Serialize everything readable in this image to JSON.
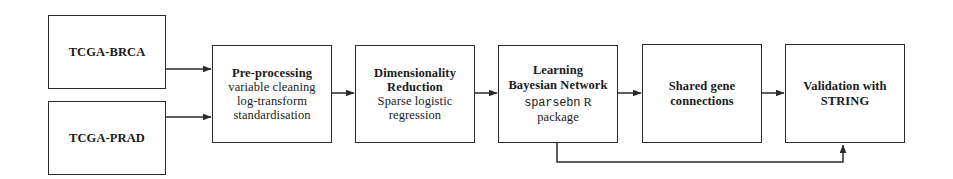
{
  "diagram": {
    "background_color": "#ffffff",
    "stroke_color": "#2a2a2a",
    "nodes": [
      {
        "id": "brca",
        "lines": [
          {
            "text": "TCGA-BRCA",
            "style": "bold"
          }
        ]
      },
      {
        "id": "prad",
        "lines": [
          {
            "text": "TCGA-PRAD",
            "style": "bold"
          }
        ]
      },
      {
        "id": "preproc",
        "lines": [
          {
            "text": "Pre-processing",
            "style": "bold"
          },
          {
            "text": "variable cleaning",
            "style": "regular"
          },
          {
            "text": "log-transform",
            "style": "regular"
          },
          {
            "text": "standardisation",
            "style": "regular"
          }
        ]
      },
      {
        "id": "dimred",
        "lines": [
          {
            "text": "Dimensionality",
            "style": "bold"
          },
          {
            "text": "Reduction",
            "style": "bold"
          },
          {
            "text": "Sparse logistic",
            "style": "regular"
          },
          {
            "text": "regression",
            "style": "regular"
          }
        ]
      },
      {
        "id": "bayes",
        "lines": [
          {
            "text": "Learning",
            "style": "bold"
          },
          {
            "text": "Bayesian Network",
            "style": "bold"
          },
          {
            "text": "sparsebn",
            "style": "mono",
            "tail": " R"
          },
          {
            "text": "package",
            "style": "regular"
          }
        ]
      },
      {
        "id": "shared",
        "lines": [
          {
            "text": "Shared gene",
            "style": "bold"
          },
          {
            "text": "connections",
            "style": "bold"
          }
        ]
      },
      {
        "id": "valid",
        "lines": [
          {
            "text": "Validation with",
            "style": "bold"
          },
          {
            "text": "STRING",
            "style": "bold"
          }
        ]
      }
    ],
    "edges": [
      {
        "id": "brca-to-preproc",
        "from": "brca",
        "to": "preproc",
        "kind": "straight-right"
      },
      {
        "id": "prad-to-preproc",
        "from": "prad",
        "to": "preproc",
        "kind": "straight-right"
      },
      {
        "id": "preproc-to-dimred",
        "from": "preproc",
        "to": "dimred",
        "kind": "straight-right"
      },
      {
        "id": "dimred-to-bayes",
        "from": "dimred",
        "to": "bayes",
        "kind": "straight-right"
      },
      {
        "id": "bayes-to-shared",
        "from": "bayes",
        "to": "shared",
        "kind": "straight-right"
      },
      {
        "id": "shared-to-valid",
        "from": "shared",
        "to": "valid",
        "kind": "straight-right"
      },
      {
        "id": "bayes-to-valid-bypass",
        "from": "bayes",
        "to": "valid",
        "kind": "bottom-bypass"
      }
    ]
  }
}
